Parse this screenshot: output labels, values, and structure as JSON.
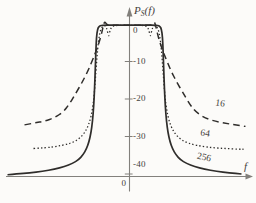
{
  "figure": {
    "background": "#fcfbf9",
    "curve_color": "#2f2d2b",
    "axis_color": "#82807c",
    "text_color": "#45413d"
  },
  "axis": {
    "y_label_main": "P",
    "y_label_sub": "S",
    "y_label_tail": "(f)",
    "x_label": "f",
    "origin_label": "0"
  },
  "chart_data": {
    "type": "line",
    "title": "",
    "ylabel": "P_S(f) [dB]",
    "xlabel": "f",
    "ylim": [
      -42,
      2
    ],
    "x_axis_numeric": false,
    "x_units": "frequency offset from band center (axis unlabeled; profile x in px offset)",
    "grid": false,
    "legend_position": "labels on curves, right side",
    "y_ticks": [
      {
        "value": 0,
        "label": "0"
      },
      {
        "value": -10,
        "label": "-10"
      },
      {
        "value": -20,
        "label": "-20"
      },
      {
        "value": -30,
        "label": "-30"
      },
      {
        "value": -40,
        "label": "-40"
      }
    ],
    "series": [
      {
        "name": "16",
        "style": "dashed",
        "flat_top_db": -0.35,
        "tail_level_db": -27.3,
        "left_cut": 108.5,
        "right_cut": 116,
        "half_profile": [
          [
            0,
            -0.35
          ],
          [
            12,
            -0.35
          ],
          [
            20,
            -0.35
          ],
          [
            23,
            -0.1
          ],
          [
            24.8,
            0.7
          ],
          [
            26,
            -0.3
          ],
          [
            26.8,
            -1.2
          ],
          [
            28,
            -2.6
          ],
          [
            30,
            -4.6
          ],
          [
            33,
            -7
          ],
          [
            36.5,
            -9.3
          ],
          [
            41,
            -12.2
          ],
          [
            47,
            -15.4
          ],
          [
            54,
            -18.6
          ],
          [
            60,
            -21.3
          ],
          [
            66,
            -23.4
          ],
          [
            75,
            -25
          ],
          [
            85,
            -25.9
          ],
          [
            95,
            -26.4
          ],
          [
            105,
            -26.9
          ],
          [
            116,
            -27.3
          ]
        ]
      },
      {
        "name": "64",
        "style": "dotted",
        "flat_top_db": -0.35,
        "tail_level_db": -33.4,
        "left_cut": 108.5,
        "right_cut": 114,
        "half_profile": [
          [
            0,
            -0.35
          ],
          [
            12,
            -0.35
          ],
          [
            17,
            -0.5
          ],
          [
            19.5,
            -1.6
          ],
          [
            20.8,
            -3.6
          ],
          [
            22.3,
            -1.6
          ],
          [
            24,
            -0.4
          ],
          [
            26.5,
            -0.5
          ],
          [
            28.8,
            -1.4
          ],
          [
            30.5,
            -3.6
          ],
          [
            31.8,
            -6.5
          ],
          [
            33,
            -10.5
          ],
          [
            34.2,
            -15
          ],
          [
            35.5,
            -19.5
          ],
          [
            37.2,
            -23
          ],
          [
            39.5,
            -25.8
          ],
          [
            42.5,
            -27.9
          ],
          [
            46,
            -29.4
          ],
          [
            50.5,
            -30.6
          ],
          [
            56,
            -31.5
          ],
          [
            63,
            -32.1
          ],
          [
            72,
            -32.6
          ],
          [
            83,
            -33
          ],
          [
            96,
            -33.2
          ],
          [
            110,
            -33.4
          ],
          [
            114,
            -33.4
          ]
        ]
      },
      {
        "name": "256",
        "style": "solid",
        "flat_top_db": -0.3,
        "tail_level_db": -40.2,
        "left_cut": 123,
        "right_cut": 118,
        "half_profile": [
          [
            0,
            -0.3
          ],
          [
            15,
            -0.3
          ],
          [
            28,
            -0.3
          ],
          [
            30.5,
            -0.6
          ],
          [
            32,
            -1.4
          ],
          [
            33,
            -3.5
          ],
          [
            33.6,
            -7
          ],
          [
            34.2,
            -12
          ],
          [
            34.9,
            -17
          ],
          [
            35.8,
            -22
          ],
          [
            37,
            -26
          ],
          [
            38.5,
            -29
          ],
          [
            40.5,
            -31.4
          ],
          [
            43,
            -33.3
          ],
          [
            46.5,
            -34.9
          ],
          [
            51,
            -36.2
          ],
          [
            57,
            -37.2
          ],
          [
            65,
            -38
          ],
          [
            75,
            -38.7
          ],
          [
            87,
            -39.3
          ],
          [
            100,
            -39.7
          ],
          [
            112,
            -40
          ],
          [
            122,
            -40.2
          ]
        ]
      }
    ],
    "annotations": [
      {
        "label": "16",
        "x": 220,
        "y": 104,
        "rotate": 9
      },
      {
        "label": "64",
        "x": 205,
        "y": 134,
        "rotate": 9
      },
      {
        "label": "256",
        "x": 204,
        "y": 158,
        "rotate": 12
      }
    ]
  }
}
